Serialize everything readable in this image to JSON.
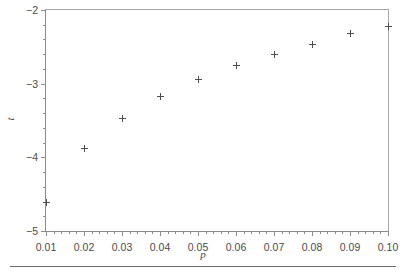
{
  "chart_data": {
    "type": "scatter",
    "title": "",
    "subtitle": "",
    "xlabel": "p",
    "ylabel": "t",
    "xlim": [
      0.01,
      0.1
    ],
    "ylim": [
      -5,
      -2
    ],
    "grid": false,
    "legend": null,
    "marker": "plus",
    "marker_color": "#4d4d4d",
    "x": [
      0.01,
      0.02,
      0.03,
      0.04,
      0.05,
      0.06,
      0.07,
      0.08,
      0.09,
      0.1
    ],
    "y": [
      -4.61,
      -3.88,
      -3.47,
      -3.18,
      -2.94,
      -2.76,
      -2.6,
      -2.47,
      -2.32,
      -2.22
    ],
    "points": [
      {
        "x": 0.01,
        "y": -4.61
      },
      {
        "x": 0.02,
        "y": -3.88
      },
      {
        "x": 0.03,
        "y": -3.47
      },
      {
        "x": 0.04,
        "y": -3.18
      },
      {
        "x": 0.05,
        "y": -2.94
      },
      {
        "x": 0.06,
        "y": -2.76
      },
      {
        "x": 0.07,
        "y": -2.6
      },
      {
        "x": 0.08,
        "y": -2.47
      },
      {
        "x": 0.09,
        "y": -2.32
      },
      {
        "x": 0.1,
        "y": -2.22
      }
    ],
    "xticks": [
      {
        "value": 0.01,
        "label": "0.01"
      },
      {
        "value": 0.02,
        "label": "0.02"
      },
      {
        "value": 0.03,
        "label": "0.03"
      },
      {
        "value": 0.04,
        "label": "0.04"
      },
      {
        "value": 0.05,
        "label": "0.05"
      },
      {
        "value": 0.06,
        "label": "0.06"
      },
      {
        "value": 0.07,
        "label": "0.07"
      },
      {
        "value": 0.08,
        "label": "0.08"
      },
      {
        "value": 0.09,
        "label": "0.09"
      },
      {
        "value": 0.1,
        "label": "0.10"
      }
    ],
    "yticks": [
      {
        "value": -2,
        "label": "−2"
      },
      {
        "value": -3,
        "label": "−3"
      },
      {
        "value": -4,
        "label": "−4"
      },
      {
        "value": -5,
        "label": "−5"
      }
    ],
    "x_minor_tick_step": 0.002,
    "y_minor_tick_step": 0.2,
    "axis_color": "#8c8c8c",
    "text_color": "#4a4a4a"
  },
  "figure": {
    "background": "#ffffff",
    "bottom_rule_color": "#6e6e6e"
  }
}
